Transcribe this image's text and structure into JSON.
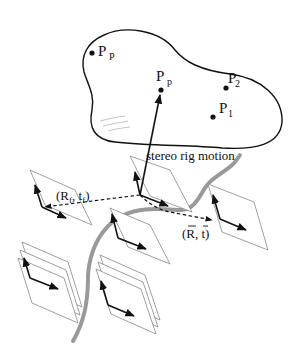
{
  "diagram": {
    "scene": {
      "points": [
        {
          "id": "PP",
          "label": "P",
          "sub": "P",
          "x": 92,
          "y": 52
        },
        {
          "id": "Pp",
          "label": "P",
          "sub": "p",
          "x": 161,
          "y": 90
        },
        {
          "id": "P2",
          "label": "P",
          "sub": "2",
          "x": 226,
          "y": 88
        },
        {
          "id": "P1",
          "label": "P",
          "sub": "1",
          "x": 213,
          "y": 117
        }
      ]
    },
    "labels": {
      "motion": "stereo rig motion",
      "ref_pose": "(R",
      "ref_pose_sub": "f",
      "ref_pose_mid": ", t",
      "ref_pose_sub2": "f",
      "ref_pose_end": ")",
      "rel_pose": "(R, t)"
    },
    "colors": {
      "line": "#111111",
      "plane_edge": "#888888",
      "trajectory": "#999999"
    }
  }
}
